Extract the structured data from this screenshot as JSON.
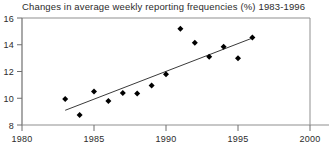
{
  "chart_data": {
    "type": "scatter",
    "title": "Changes in average weekly reporting frequencies (%) 1983-1996",
    "xlabel": "",
    "ylabel": "",
    "xlim": [
      1980,
      2000
    ],
    "ylim": [
      8,
      16
    ],
    "xticks": [
      1980,
      1985,
      1990,
      1995,
      2000
    ],
    "yticks": [
      8,
      10,
      12,
      14,
      16
    ],
    "xtick_labels": [
      "1980",
      "1985",
      "1990",
      "1995",
      "2000"
    ],
    "ytick_labels": [
      "8",
      "10",
      "12",
      "14",
      "16"
    ],
    "grid": false,
    "legend": "none",
    "marker": "diamond",
    "marker_color": "#000000",
    "line_color": "#3a3a3a",
    "axis_color": "#8a8a8a",
    "x": [
      1983,
      1984,
      1985,
      1986,
      1987,
      1988,
      1989,
      1990,
      1991,
      1992,
      1993,
      1994,
      1995,
      1996
    ],
    "values": [
      9.95,
      8.75,
      10.5,
      9.8,
      10.4,
      10.35,
      10.95,
      11.8,
      15.2,
      14.15,
      13.1,
      13.85,
      13.0,
      14.55
    ],
    "series": [
      {
        "name": "Average weekly reporting frequency",
        "values": [
          9.95,
          8.75,
          10.5,
          9.8,
          10.4,
          10.35,
          10.95,
          11.8,
          15.2,
          14.15,
          13.1,
          13.85,
          13.0,
          14.55
        ]
      }
    ],
    "trendline": {
      "type": "linear-fit",
      "x_start": 1983,
      "y_start": 9.1,
      "x_end": 1996,
      "y_end": 14.5
    }
  }
}
